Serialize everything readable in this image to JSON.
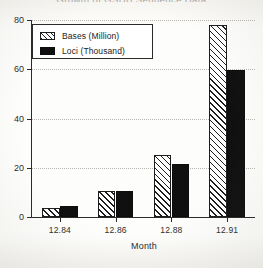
{
  "chart_data": {
    "type": "bar",
    "title": "Growth of GSDB Sequence Data",
    "xlabel": "Month",
    "ylabel": "",
    "categories": [
      "12.84",
      "12.86",
      "12.88",
      "12.91"
    ],
    "series": [
      {
        "name": "Bases  (Million)",
        "values": [
          3.5,
          10.5,
          25.0,
          78.0
        ],
        "fill": "hatch"
      },
      {
        "name": "Loci   (Thousand)",
        "values": [
          4.5,
          10.5,
          21.5,
          59.5
        ],
        "fill": "solid"
      }
    ],
    "ylim": [
      0,
      80
    ],
    "yticks": [
      0,
      20,
      40,
      60,
      80
    ],
    "ytick_labels": [
      "0",
      "20",
      "40",
      "60",
      "80"
    ],
    "grid": true,
    "grid_style": "dotted",
    "legend_position": "top-left",
    "colors": {
      "axis": "#2a2a2a",
      "grid": "#b9b7b2",
      "hatch_bar": "#ffffff",
      "hatch_line": "#1d1d1d",
      "solid_bar": "#101010",
      "background": "#fdfdfb",
      "text": "#2d2d2d"
    }
  },
  "legend": {
    "items": [
      {
        "label": "Bases  (Million)"
      },
      {
        "label": "Loci   (Thousand)"
      }
    ]
  }
}
